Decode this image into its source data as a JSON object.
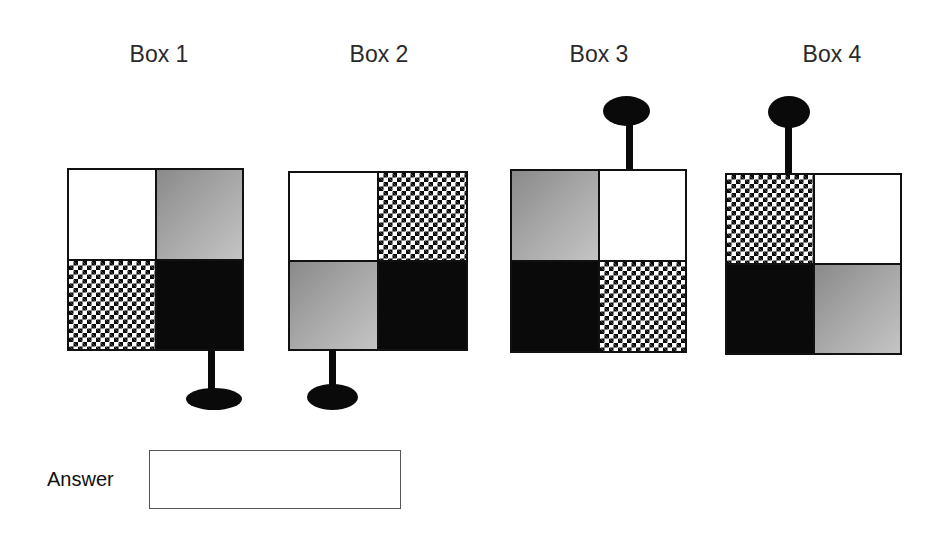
{
  "boxes": [
    {
      "label": "Box 1",
      "cells": {
        "top_left": "white",
        "top_right": "gray-gradient",
        "bottom_left": "checker",
        "bottom_right": "black"
      },
      "handle": {
        "position": "bottom",
        "side": "right"
      }
    },
    {
      "label": "Box 2",
      "cells": {
        "top_left": "white",
        "top_right": "checker",
        "bottom_left": "gray-gradient",
        "bottom_right": "black"
      },
      "handle": {
        "position": "bottom",
        "side": "left"
      }
    },
    {
      "label": "Box 3",
      "cells": {
        "top_left": "gray-gradient",
        "top_right": "white",
        "bottom_left": "black",
        "bottom_right": "checker"
      },
      "handle": {
        "position": "top",
        "side": "right"
      }
    },
    {
      "label": "Box 4",
      "cells": {
        "top_left": "checker",
        "top_right": "white",
        "bottom_left": "black",
        "bottom_right": "gray-gradient"
      },
      "handle": {
        "position": "top",
        "side": "left"
      }
    }
  ],
  "answer": {
    "label": "Answer",
    "value": "",
    "placeholder": ""
  },
  "colors": {
    "black": "#0a0a0a",
    "white": "#ffffff",
    "gray_dark": "#8a8a8a",
    "gray_light": "#c4c4c4",
    "label_text": "#2a2a2a"
  }
}
